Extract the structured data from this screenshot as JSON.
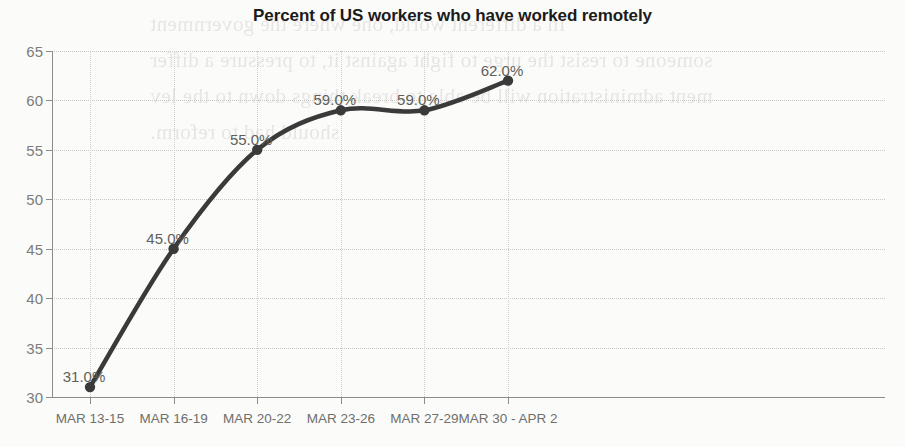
{
  "chart_data": {
    "type": "line",
    "title": "Percent of US workers who have worked remotely",
    "xlabel": "",
    "ylabel": "",
    "ylim": [
      30,
      65
    ],
    "yticks": [
      30,
      35,
      40,
      45,
      50,
      55,
      60,
      65
    ],
    "grid": true,
    "legend": false,
    "categories": [
      "MAR 13-15",
      "MAR 16-19",
      "MAR 20-22",
      "MAR 23-26",
      "MAR 27-29",
      "MAR 30 - APR 2"
    ],
    "values": [
      31.0,
      45.0,
      55.0,
      59.0,
      59.0,
      62.0
    ],
    "point_labels": [
      "31.0%",
      "45.0%",
      "55.0%",
      "59.0%",
      "59.0%",
      "62.0%"
    ],
    "series_color": "#3a3a3a",
    "grid_color": "#c9c9c4",
    "axis_color": "#8d8d88",
    "tick_label_color": "#7c7c78",
    "title_color": "#1b1b1b"
  },
  "scan_artifact": {
    "description": "faint bleed-through text from reverse side of scanned page",
    "lines": [
      "In a different world, one where the government",
      "someone to resist the urge to fight against it, to pressure a differ",
      "ment administration will be able to break things down to the lev",
      "should had to reform."
    ]
  }
}
